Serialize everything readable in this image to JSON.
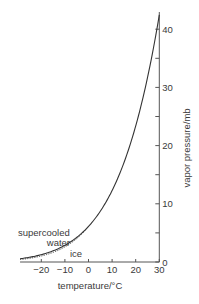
{
  "chart_data": {
    "type": "line",
    "title": "",
    "xlabel": "temperature/°C",
    "ylabel": "vapor pressure/mb",
    "xlim": [
      -29,
      30
    ],
    "ylim": [
      0,
      43
    ],
    "grid": false,
    "legend": "none (inline annotations)",
    "x_ticks": [
      -20,
      -10,
      0,
      10,
      20,
      30
    ],
    "x_tick_labels": [
      "−20",
      "−10",
      "0",
      "10",
      "20",
      "30"
    ],
    "y_ticks_major": [
      0,
      10,
      20,
      30,
      40
    ],
    "y_tick_labels": [
      "0",
      "10",
      "20",
      "30",
      "40"
    ],
    "y_ticks_minor": [
      5,
      15,
      25,
      35
    ],
    "y_axis_position": "right",
    "series": [
      {
        "name": "supercooled water",
        "style": "solid",
        "x": [
          -29,
          -25,
          -20,
          -15,
          -10,
          -5,
          0,
          5,
          10,
          15,
          20,
          25,
          30
        ],
        "values": [
          0.47,
          0.81,
          1.25,
          1.91,
          2.86,
          4.21,
          6.11,
          8.72,
          12.27,
          17.04,
          23.37,
          31.67,
          42.43
        ]
      },
      {
        "name": "ice",
        "style": "dotted",
        "x": [
          -29,
          -25,
          -20,
          -15,
          -10,
          -5,
          0
        ],
        "values": [
          0.38,
          0.63,
          1.03,
          1.65,
          2.6,
          4.02,
          6.11
        ]
      }
    ],
    "annotations": [
      {
        "text": "supercooled",
        "near": "water curve, lower left"
      },
      {
        "text": "water",
        "near": "water curve, lower left"
      },
      {
        "text": "ice",
        "near": "ice curve, below"
      }
    ]
  },
  "labels": {
    "xlabel": "temperature/°C",
    "ylabel": "vapor pressure/mb",
    "annot_line1": "supercooled",
    "annot_line2": "water",
    "annot_ice": "ice"
  },
  "colors": {
    "axis": "#555555",
    "curve": "#333333",
    "text": "#3a3a3a"
  }
}
